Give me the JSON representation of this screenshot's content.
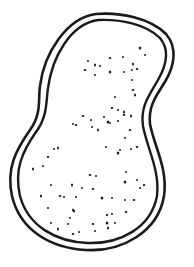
{
  "figure": {
    "description": "Line drawing of a peanut-shaped cell with a double outline and scattered dots inside",
    "stroke_color": "#1a1a1a",
    "background": "#ffffff",
    "outer_path": "M96,14 C120,12 150,18 166,34 C178,48 174,66 166,80 C158,94 148,104 150,124 C154,146 168,168 164,196 C158,232 122,252 86,250 C50,248 20,230 12,196 C6,168 16,150 30,130 C42,114 38,98 40,86 C44,54 66,18 96,14 Z",
    "inner_path": "M98,20 C120,19 146,24 160,38 C170,50 166,66 158,80 C150,94 140,106 143,126 C147,148 160,170 157,196 C151,228 120,244 88,243 C56,242 28,226 20,196 C14,170 22,152 36,132 C48,116 46,100 48,88 C52,58 70,24 98,20 Z",
    "dots": [
      [
        140,
        48
      ],
      [
        145,
        55
      ],
      [
        88,
        61
      ],
      [
        85,
        70
      ],
      [
        95,
        65
      ],
      [
        100,
        66
      ],
      [
        110,
        58
      ],
      [
        123,
        57
      ],
      [
        133,
        64
      ],
      [
        137,
        69
      ],
      [
        132,
        70
      ],
      [
        124,
        72
      ],
      [
        110,
        72
      ],
      [
        95,
        75
      ],
      [
        132,
        80
      ],
      [
        133,
        90
      ],
      [
        135,
        95
      ],
      [
        115,
        97
      ],
      [
        112,
        108
      ],
      [
        118,
        110
      ],
      [
        124,
        112
      ],
      [
        83,
        116
      ],
      [
        91,
        120
      ],
      [
        104,
        117
      ],
      [
        108,
        122
      ],
      [
        110,
        123
      ],
      [
        118,
        121
      ],
      [
        124,
        115
      ],
      [
        131,
        116
      ],
      [
        73,
        124
      ],
      [
        76,
        125
      ],
      [
        92,
        127
      ],
      [
        98,
        130
      ],
      [
        130,
        130
      ],
      [
        125,
        138
      ],
      [
        106,
        147
      ],
      [
        118,
        153
      ],
      [
        120,
        150
      ],
      [
        131,
        149
      ],
      [
        137,
        147
      ],
      [
        58,
        148
      ],
      [
        54,
        149
      ],
      [
        48,
        157
      ],
      [
        43,
        166
      ],
      [
        33,
        169
      ],
      [
        90,
        175
      ],
      [
        96,
        176
      ],
      [
        126,
        172
      ],
      [
        125,
        182
      ],
      [
        137,
        180
      ],
      [
        140,
        188
      ],
      [
        144,
        185
      ],
      [
        72,
        185
      ],
      [
        82,
        188
      ],
      [
        93,
        189
      ],
      [
        51,
        185
      ],
      [
        41,
        196
      ],
      [
        60,
        196
      ],
      [
        64,
        197
      ],
      [
        76,
        197
      ],
      [
        102,
        198
      ],
      [
        112,
        198
      ],
      [
        125,
        200
      ],
      [
        134,
        200
      ],
      [
        73,
        210
      ],
      [
        112,
        214
      ],
      [
        126,
        212
      ],
      [
        48,
        208
      ],
      [
        74,
        211
      ],
      [
        107,
        215
      ],
      [
        70,
        218
      ],
      [
        115,
        223
      ],
      [
        107,
        223
      ],
      [
        51,
        223
      ],
      [
        68,
        224
      ],
      [
        93,
        224
      ],
      [
        58,
        229
      ],
      [
        79,
        232
      ],
      [
        73,
        234
      ],
      [
        95,
        231
      ],
      [
        108,
        228
      ]
    ]
  }
}
